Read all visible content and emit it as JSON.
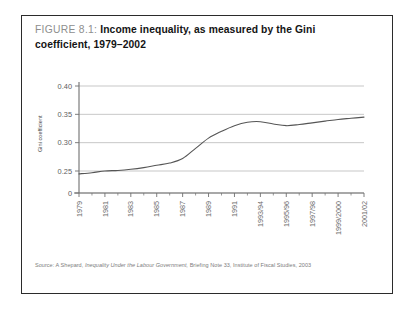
{
  "figure": {
    "number_label": "FIGURE 8.1:",
    "title": "Income inequality, as measured by the Gini coefficient, 1979–2002",
    "source_prefix": "Source:",
    "source_author": "A Shepard,",
    "source_work": "Inequality Under the Labour Government,",
    "source_rest": "Briefing Note 33, Institute of Fiscal Studies, 2003",
    "source_full": "Source: A Shepard, Inequality Under the Labour Government, Briefing Note 33, Institute of Fiscal Studies, 2003",
    "border_color": "#2b2b2b",
    "line_color": "#555555",
    "grid_color": "#b9b9b9",
    "axis_color": "#6f6f6f"
  },
  "chart_data": {
    "type": "line",
    "title": "Income inequality, as measured by the Gini coefficient, 1979–2002",
    "xlabel": "",
    "ylabel": "Gini coefficient",
    "grid": true,
    "legend": "none",
    "axis_break": true,
    "ylim": [
      0.22,
      0.41
    ],
    "ytick_values": [
      0,
      0.25,
      0.3,
      0.35,
      0.4
    ],
    "ytick_labels": [
      "0",
      "0.25",
      "0.30",
      "0.35",
      "0.40"
    ],
    "xtick_labels": [
      "1979",
      "1981",
      "1983",
      "1985",
      "1987",
      "1989",
      "1991",
      "1993/94",
      "1995/96",
      "1997/98",
      "1999/2000",
      "2001/02"
    ],
    "categories": [
      "1979",
      "1980",
      "1981",
      "1982",
      "1983",
      "1984",
      "1985",
      "1986",
      "1987",
      "1988",
      "1989",
      "1990",
      "1991",
      "1992",
      "1993/94",
      "1994/95",
      "1995/96",
      "1996/97",
      "1997/98",
      "1998/99",
      "1999/2000",
      "2000/01",
      "2001/02"
    ],
    "series": [
      {
        "name": "Gini coefficient",
        "values": [
          0.245,
          0.247,
          0.25,
          0.251,
          0.253,
          0.256,
          0.26,
          0.264,
          0.272,
          0.29,
          0.308,
          0.32,
          0.33,
          0.336,
          0.337,
          0.333,
          0.33,
          0.332,
          0.335,
          0.338,
          0.341,
          0.343,
          0.345
        ]
      }
    ]
  }
}
